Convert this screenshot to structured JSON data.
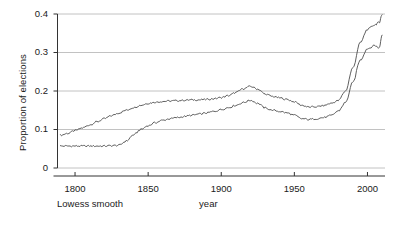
{
  "figure": {
    "caption": "Lowess smooth",
    "background": "#ffffff",
    "line_color": "#4d4d4d",
    "grid_color": "#b3b3b3",
    "axis_color": "#333333"
  },
  "chart_data": {
    "type": "line",
    "title": "",
    "xlabel": "year",
    "ylabel": "Proportion of elections",
    "annotation": "Lowess smooth",
    "xlim": [
      1788,
      2012
    ],
    "ylim": [
      0,
      0.4
    ],
    "xticks": [
      1800,
      1850,
      1900,
      1950,
      2000
    ],
    "xtick_labels": [
      "1800",
      "1850",
      "1900",
      "1950",
      "2000"
    ],
    "yticks": [
      0,
      0.1,
      0.2,
      0.3,
      0.4
    ],
    "ytick_labels": [
      "0",
      "0.1",
      "0.2",
      "0.3",
      "0.4"
    ],
    "grid": true,
    "grid_axis": "y",
    "legend": "none",
    "x": [
      1790,
      1795,
      1800,
      1805,
      1810,
      1815,
      1820,
      1825,
      1830,
      1835,
      1840,
      1845,
      1850,
      1855,
      1860,
      1865,
      1870,
      1875,
      1880,
      1885,
      1890,
      1895,
      1900,
      1905,
      1910,
      1915,
      1920,
      1925,
      1930,
      1935,
      1940,
      1945,
      1950,
      1955,
      1960,
      1965,
      1970,
      1975,
      1980,
      1985,
      1990,
      1995,
      2000,
      2005,
      2008,
      2010
    ],
    "series": [
      {
        "name": "upper curve",
        "values": [
          0.085,
          0.09,
          0.097,
          0.104,
          0.112,
          0.12,
          0.128,
          0.136,
          0.143,
          0.15,
          0.157,
          0.163,
          0.168,
          0.171,
          0.173,
          0.174,
          0.175,
          0.176,
          0.177,
          0.177,
          0.178,
          0.18,
          0.183,
          0.188,
          0.196,
          0.206,
          0.212,
          0.205,
          0.192,
          0.186,
          0.182,
          0.178,
          0.172,
          0.163,
          0.158,
          0.159,
          0.162,
          0.168,
          0.175,
          0.2,
          0.26,
          0.325,
          0.36,
          0.372,
          0.378,
          0.398
        ]
      },
      {
        "name": "lower curve",
        "values": [
          0.057,
          0.057,
          0.057,
          0.057,
          0.057,
          0.057,
          0.057,
          0.058,
          0.059,
          0.07,
          0.086,
          0.1,
          0.11,
          0.118,
          0.124,
          0.128,
          0.131,
          0.134,
          0.137,
          0.14,
          0.143,
          0.147,
          0.152,
          0.157,
          0.163,
          0.17,
          0.176,
          0.168,
          0.156,
          0.15,
          0.147,
          0.143,
          0.137,
          0.128,
          0.126,
          0.128,
          0.131,
          0.136,
          0.148,
          0.17,
          0.222,
          0.28,
          0.31,
          0.318,
          0.312,
          0.345
        ]
      }
    ]
  }
}
